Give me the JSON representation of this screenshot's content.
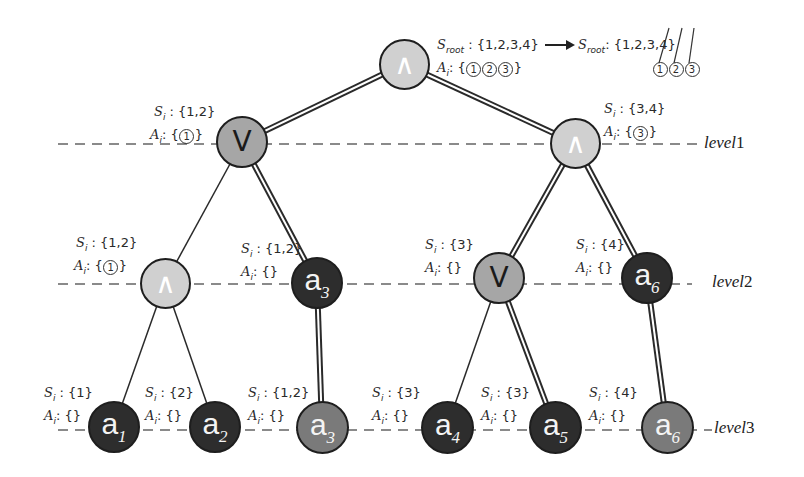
{
  "diagram": {
    "type": "attack-defense tree",
    "colors": {
      "and_node": "#d0d0d0",
      "or_node": "#a6a6a6",
      "leaf_dark": "#2d2d2d",
      "leaf_medium": "#7a7a7a",
      "edge": "#2a2a2a",
      "level_line": "#8a8a8a"
    },
    "levels": [
      {
        "id": "level1",
        "label": "level",
        "num": "1"
      },
      {
        "id": "level2",
        "label": "level",
        "num": "2"
      },
      {
        "id": "level3",
        "label": "level",
        "num": "3"
      }
    ],
    "nodes": [
      {
        "id": "root",
        "kind": "and",
        "symbol": "∧",
        "level": 0
      },
      {
        "id": "n1",
        "kind": "or",
        "symbol": "V",
        "level": 1
      },
      {
        "id": "n2",
        "kind": "and",
        "symbol": "∧",
        "level": 1
      },
      {
        "id": "n3",
        "kind": "and",
        "symbol": "∧",
        "level": 2
      },
      {
        "id": "n4",
        "kind": "leaf-dark",
        "label": "a",
        "sub": "3",
        "level": 2
      },
      {
        "id": "n5",
        "kind": "or",
        "symbol": "V",
        "level": 2
      },
      {
        "id": "n6",
        "kind": "leaf-dark",
        "label": "a",
        "sub": "6",
        "level": 2
      },
      {
        "id": "l1",
        "kind": "leaf-dark",
        "label": "a",
        "sub": "1",
        "level": 3
      },
      {
        "id": "l2",
        "kind": "leaf-dark",
        "label": "a",
        "sub": "2",
        "level": 3
      },
      {
        "id": "l3",
        "kind": "leaf-medium",
        "label": "a",
        "sub": "3",
        "level": 3
      },
      {
        "id": "l4",
        "kind": "leaf-dark",
        "label": "a",
        "sub": "4",
        "level": 3
      },
      {
        "id": "l5",
        "kind": "leaf-dark",
        "label": "a",
        "sub": "5",
        "level": 3
      },
      {
        "id": "l6",
        "kind": "leaf-medium",
        "label": "a",
        "sub": "6",
        "level": 3
      }
    ],
    "edges": [
      {
        "from": "root",
        "to": "n1",
        "style": "double"
      },
      {
        "from": "root",
        "to": "n2",
        "style": "double"
      },
      {
        "from": "n1",
        "to": "n3",
        "style": "single"
      },
      {
        "from": "n1",
        "to": "n4",
        "style": "double"
      },
      {
        "from": "n2",
        "to": "n5",
        "style": "double"
      },
      {
        "from": "n2",
        "to": "n6",
        "style": "double"
      },
      {
        "from": "n3",
        "to": "l1",
        "style": "single"
      },
      {
        "from": "n3",
        "to": "l2",
        "style": "single"
      },
      {
        "from": "n4",
        "to": "l3",
        "style": "double"
      },
      {
        "from": "n5",
        "to": "l4",
        "style": "single"
      },
      {
        "from": "n5",
        "to": "l5",
        "style": "double"
      },
      {
        "from": "n6",
        "to": "l6",
        "style": "double"
      }
    ],
    "annotations": {
      "root": {
        "s_label": "S",
        "s_sub": "root",
        "s_value": ": {1,2,3,4}",
        "a_label": "A",
        "a_sub": "i",
        "a_prefix": ": {",
        "a_items": [
          "1",
          "2",
          "3"
        ],
        "a_suffix": "}",
        "arrow": "→",
        "result_s_label": "S",
        "result_s_sub": "root",
        "result_s_value": ": {1,2,3,4}",
        "result_items": [
          "1",
          "2",
          "3"
        ],
        "note": "elements 1,2,3 struck through and mapped to circled 1,2,3"
      },
      "n1": {
        "s_value": ": {1,2}",
        "a_prefix": ": {",
        "a_items": [
          "1"
        ],
        "a_suffix": "}"
      },
      "n2": {
        "s_value": ": {3,4}",
        "a_prefix": ": {",
        "a_items": [
          "3"
        ],
        "a_suffix": "}"
      },
      "n3": {
        "s_value": ": {1,2}",
        "a_prefix": ": {",
        "a_items": [
          "1"
        ],
        "a_suffix": "}"
      },
      "n4": {
        "s_value": ": {1,2}",
        "a_value": ": {}"
      },
      "n5": {
        "s_value": ": {3}",
        "a_value": ": {}"
      },
      "n6": {
        "s_value": ": {4}",
        "a_value": ": {}"
      },
      "l1": {
        "s_value": ": {1}",
        "a_value": ": {}"
      },
      "l2": {
        "s_value": ": {2}",
        "a_value": ": {}"
      },
      "l3": {
        "s_value": ": {1,2}",
        "a_value": ": {}"
      },
      "l4": {
        "s_value": ": {3}",
        "a_value": ": {}"
      },
      "l5": {
        "s_value": ": {3}",
        "a_value": ": {}"
      },
      "l6": {
        "s_value": ": {4}",
        "a_value": ": {}"
      }
    },
    "common": {
      "s_label": "S",
      "a_label": "A",
      "sub": "i"
    }
  }
}
